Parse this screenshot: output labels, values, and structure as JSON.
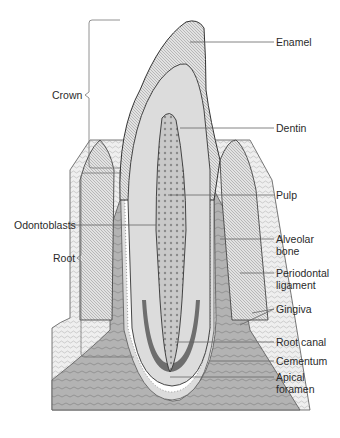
{
  "diagram": {
    "regions": [
      {
        "id": "crown",
        "label": "Crown"
      },
      {
        "id": "root",
        "label": "Root"
      }
    ],
    "labels_left": [
      {
        "id": "crown",
        "text": "Crown"
      },
      {
        "id": "odontoblasts",
        "text": "Odontoblasts"
      },
      {
        "id": "root",
        "text": "Root"
      }
    ],
    "labels_right": [
      {
        "id": "enamel",
        "text": "Enamel"
      },
      {
        "id": "dentin",
        "text": "Dentin"
      },
      {
        "id": "pulp",
        "text": "Pulp"
      },
      {
        "id": "alveolar_bone",
        "line1": "Alveolar",
        "line2": "bone"
      },
      {
        "id": "periodontal_ligament",
        "line1": "Periodontal",
        "line2": "ligament"
      },
      {
        "id": "gingiva",
        "text": "Gingiva"
      },
      {
        "id": "root_canal",
        "text": "Root canal"
      },
      {
        "id": "cementum",
        "text": "Cementum"
      },
      {
        "id": "apical_foramen",
        "line1": "Apical",
        "line2": "foramen"
      }
    ],
    "colors": {
      "line": "#555555",
      "enamel": "#d8d8d8",
      "dentin": "#e6e6e6",
      "pulp": "#bdbdbd",
      "bone": "#a9a9a9",
      "gingiva": "#cfcfcf",
      "soft": "#eeeeee"
    }
  }
}
